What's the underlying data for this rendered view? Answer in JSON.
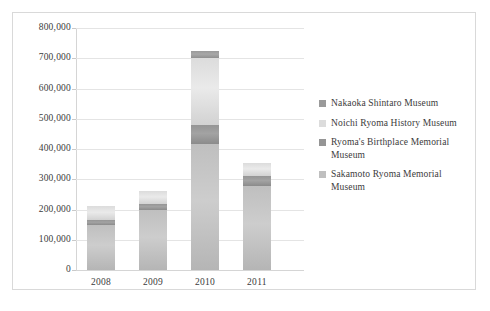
{
  "chart_data": {
    "type": "bar",
    "subtype": "stacked-column",
    "title": "",
    "xlabel": "",
    "ylabel": "",
    "categories": [
      "2008",
      "2009",
      "2010",
      "2011"
    ],
    "ylim": [
      0,
      800000
    ],
    "ytick_values": [
      800000,
      700000,
      600000,
      500000,
      400000,
      300000,
      200000,
      100000,
      0
    ],
    "ytick_labels": [
      "800,000",
      "700,000",
      "600,000",
      "500,000",
      "400,000",
      "300,000",
      "200,000",
      "100,000",
      "0"
    ],
    "grid": true,
    "legend_position": "right",
    "series": [
      {
        "name": "Sakamoto Ryoma Memorial Museum",
        "color": "#bfbfbf",
        "values": [
          148000,
          200000,
          418000,
          278000
        ]
      },
      {
        "name": "Ryoma's Birthplace Memorial Museum",
        "color": "#959595",
        "values": [
          16000,
          18000,
          62000,
          32000
        ]
      },
      {
        "name": "Noichi Ryoma History Museum",
        "color": "#dcdcdc",
        "values": [
          46000,
          42000,
          220000,
          45000
        ]
      },
      {
        "name": "Nakaoka Shintaro Museum",
        "color": "#9a9a9a",
        "values": [
          0,
          0,
          25000,
          0
        ]
      }
    ],
    "totals": [
      210000,
      260000,
      725000,
      355000
    ]
  },
  "legend": {
    "items": [
      {
        "label": "Nakaoka Shintaro Museum",
        "color": "#9a9a9a"
      },
      {
        "label": "Noichi Ryoma History Museum",
        "color": "#dcdcdc"
      },
      {
        "label": "Ryoma's Birthplace Memorial Museum",
        "color": "#959595"
      },
      {
        "label": "Sakamoto Ryoma Memorial Museum",
        "color": "#bfbfbf"
      }
    ]
  },
  "style": {
    "frame_border": "#d9d9d9",
    "gridline": "#e4e4e4",
    "axis": "#d5d5d5",
    "text": "#3b3b3b",
    "background": "#ffffff"
  }
}
